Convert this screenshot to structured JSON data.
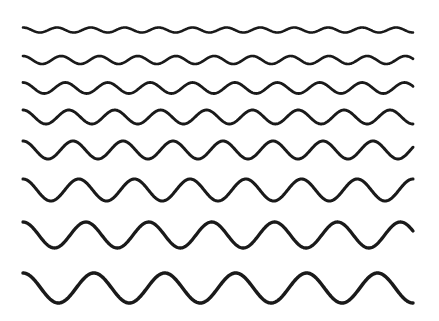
{
  "figure": {
    "width": 439,
    "height": 321,
    "background_color": "#FFFFFF",
    "stroke_color": "#1A1A1A",
    "margin_left": 23,
    "margin_right": 413,
    "start_phase": "crest"
  },
  "chart_data": {
    "type": "line",
    "title": "",
    "subtitle": "",
    "xlabel": "",
    "ylabel": "",
    "grid": false,
    "legend": "none",
    "x_range": [
      23,
      413
    ],
    "y_range": [
      0,
      321
    ],
    "series": [
      {
        "name": "wave-1",
        "row": 1,
        "center_y": 30,
        "amplitude": 2.5,
        "cycles": 11.5,
        "wavelength": 33.9,
        "stroke_width": 2.6,
        "color": "#1A1A1A"
      },
      {
        "name": "wave-2",
        "row": 2,
        "center_y": 60,
        "amplitude": 4,
        "cycles": 10.2,
        "wavelength": 38.2,
        "stroke_width": 2.7,
        "color": "#1A1A1A"
      },
      {
        "name": "wave-3",
        "row": 3,
        "center_y": 88,
        "amplitude": 5.5,
        "cycles": 9.2,
        "wavelength": 42.4,
        "stroke_width": 2.8,
        "color": "#1A1A1A"
      },
      {
        "name": "wave-4",
        "row": 4,
        "center_y": 117,
        "amplitude": 7,
        "cycles": 8.5,
        "wavelength": 45.9,
        "stroke_width": 2.9,
        "color": "#1A1A1A"
      },
      {
        "name": "wave-5",
        "row": 5,
        "center_y": 150,
        "amplitude": 9,
        "cycles": 7.8,
        "wavelength": 50.0,
        "stroke_width": 3.0,
        "color": "#1A1A1A"
      },
      {
        "name": "wave-6",
        "row": 6,
        "center_y": 190,
        "amplitude": 11,
        "cycles": 7.0,
        "wavelength": 55.7,
        "stroke_width": 3.1,
        "color": "#1A1A1A"
      },
      {
        "name": "wave-7",
        "row": 7,
        "center_y": 235,
        "amplitude": 13,
        "cycles": 6.2,
        "wavelength": 62.9,
        "stroke_width": 3.3,
        "color": "#1A1A1A"
      },
      {
        "name": "wave-8",
        "row": 8,
        "center_y": 288,
        "amplitude": 15,
        "cycles": 5.5,
        "wavelength": 70.9,
        "stroke_width": 3.5,
        "color": "#1A1A1A"
      }
    ]
  }
}
